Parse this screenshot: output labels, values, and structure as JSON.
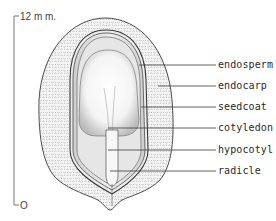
{
  "figure": {
    "type": "botanical cross-section of a seed within its fruit",
    "scale_bar": {
      "top_label": "12 m m.",
      "bottom_label": "O"
    },
    "labels": [
      {
        "id": "endosperm",
        "text": "endosperm",
        "y": 65
      },
      {
        "id": "endocarp",
        "text": "endocarp",
        "y": 86
      },
      {
        "id": "seedcoat",
        "text": "seedcoat",
        "y": 107
      },
      {
        "id": "cotyledon",
        "text": "cotyledon",
        "y": 128
      },
      {
        "id": "hypocotyl",
        "text": "hypocotyl",
        "y": 150
      },
      {
        "id": "radicle",
        "text": "radicle",
        "y": 171
      }
    ],
    "colors": {
      "ink": "#3a3a3a",
      "stipple": "#9a9a9a",
      "shade": "#d6d6d6",
      "background": "#ffffff"
    }
  }
}
